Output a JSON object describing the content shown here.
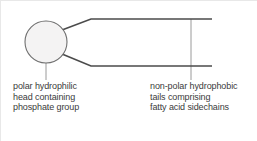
{
  "diagram": {
    "background_color": "#ffffff",
    "head": {
      "shape": "circle",
      "fill_color": "#f4f3f3",
      "stroke_color": "#6f6f6f",
      "center_x": 46,
      "center_y": 42,
      "radius": 21
    },
    "tails": {
      "stroke_color": "#4b4b4b",
      "count": 2,
      "upper": {
        "x1": 63,
        "y1": 31,
        "x2": 91,
        "y2": 19,
        "x3": 212,
        "y3": 19
      },
      "lower": {
        "x1": 63,
        "y1": 54,
        "x2": 91,
        "y2": 66,
        "x3": 212,
        "y3": 66
      }
    },
    "leaders": {
      "stroke_color": "#9a9a9a",
      "head_leader": {
        "x": 46,
        "y1": 54,
        "y2": 80
      },
      "tails_leader": {
        "x": 191,
        "y1": 19,
        "y2": 80
      }
    }
  },
  "labels": {
    "head": {
      "name": "polar-hydrophilic-head-label",
      "lines": [
        "polar hydrophilic",
        "head containing",
        "phosphate group"
      ]
    },
    "tails": {
      "name": "non-polar-hydrophobic-tails-label",
      "lines": [
        "non-polar hydrophobic",
        "tails comprising",
        "fatty acid sidechains"
      ]
    }
  }
}
